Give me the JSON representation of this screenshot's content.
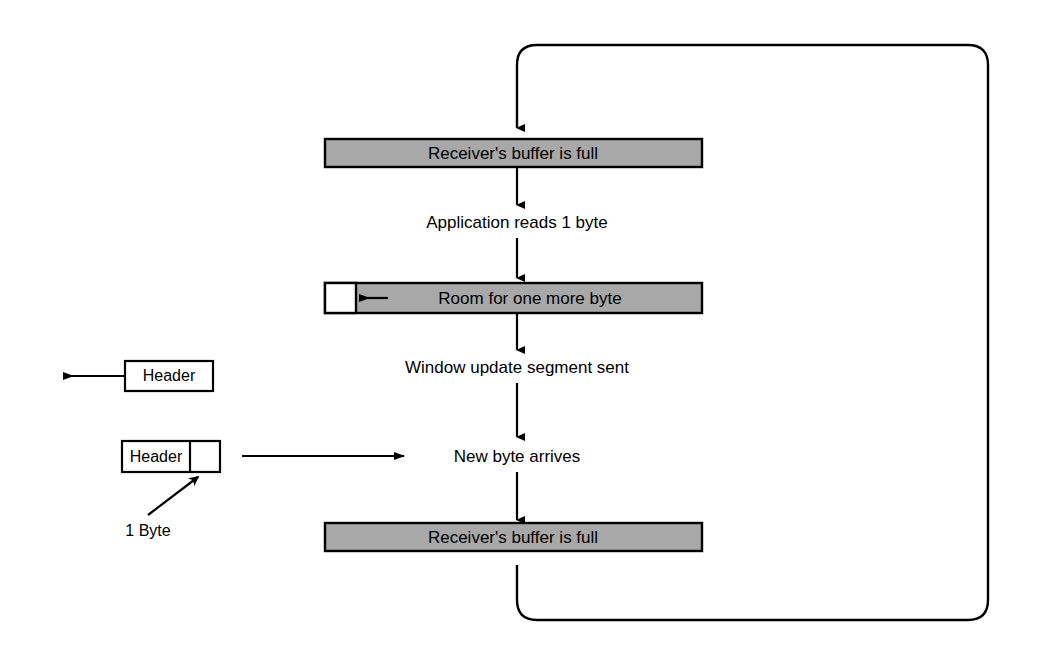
{
  "diagram": {
    "colors": {
      "stroke": "#000000",
      "buffer_fill": "#a8a8a8",
      "empty_fill": "#ffffff",
      "background": "#ffffff"
    },
    "buffers": [
      {
        "id": "buffer-full-top",
        "label": "Receiver's buffer is full",
        "fill": "#a8a8a8"
      },
      {
        "id": "buffer-room",
        "label": "Room for one more byte",
        "fill": "#a8a8a8"
      },
      {
        "id": "buffer-full-bottom",
        "label": "Receiver's buffer is full",
        "fill": "#a8a8a8"
      }
    ],
    "steps": [
      {
        "id": "step-application-reads",
        "label": "Application reads 1 byte"
      },
      {
        "id": "step-window-update",
        "label": "Window update segment sent"
      },
      {
        "id": "step-new-byte",
        "label": "New byte arrives"
      }
    ],
    "segments": [
      {
        "id": "segment-outgoing",
        "label": "Header",
        "direction": "left"
      },
      {
        "id": "segment-incoming",
        "label": "Header",
        "direction": "right"
      }
    ],
    "annotations": [
      {
        "id": "annotation-one-byte",
        "label": "1 Byte"
      }
    ]
  }
}
